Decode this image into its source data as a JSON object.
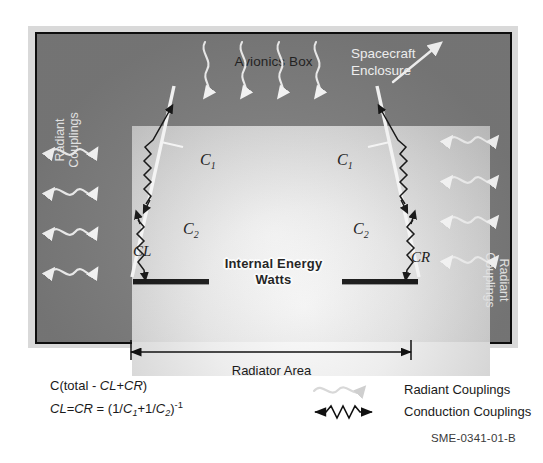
{
  "diagram": {
    "enclosure_label": "Spacecraft\nEnclosure",
    "enclosure_label_line1": "Spacecraft",
    "enclosure_label_line2": "Enclosure",
    "avionics_title": "Avionics Box",
    "internal_energy_line1": "Internal Energy",
    "internal_energy_line2": "Watts",
    "left_coupling_label_line1": "Radiant",
    "left_coupling_label_line2": "Couplings",
    "right_coupling_label_line1": "Radiant",
    "right_coupling_label_line2": "Couplings",
    "radiator_area_label": "Radiator Area",
    "conductor_left_label": "CL",
    "conductor_right_label": "CR",
    "c1_left_label": "C",
    "c1_left_sub": "1",
    "c2_left_label": "C",
    "c2_left_sub": "2",
    "c1_right_label": "C",
    "c1_right_sub": "1",
    "c2_right_label": "C",
    "c2_right_sub": "2"
  },
  "formulas": {
    "line1_prefix": "C(total - ",
    "line1_cl": "CL",
    "line1_plus": "+",
    "line1_cr": "CR",
    "line1_suffix": ")",
    "line2_cl": "CL",
    "line2_eq1": "=",
    "line2_cr": "CR",
    "line2_eq2": " = (1/",
    "line2_c1": "C",
    "line2_c1_sub": "1",
    "line2_mid": "+1/",
    "line2_c2": "C",
    "line2_c2_sub": "2",
    "line2_close": ")",
    "line2_exp": "-1"
  },
  "legend": {
    "items": [
      {
        "symbol": "radiant-coupling-symbol",
        "label": "Radiant Couplings"
      },
      {
        "symbol": "conduction-coupling-symbol",
        "label": "Conduction Couplings"
      }
    ]
  },
  "footer": {
    "document_code": "SME-0341-01-B"
  },
  "colors": {
    "enclosure_fill": "#7d7d7d",
    "enclosure_border": "#0d0d0d",
    "avionics_fill": "#ededed",
    "radiator_bar": "#121212",
    "coupling_white": "#ffffff",
    "conduction_black": "#111111",
    "page_background": "#ffffff"
  }
}
